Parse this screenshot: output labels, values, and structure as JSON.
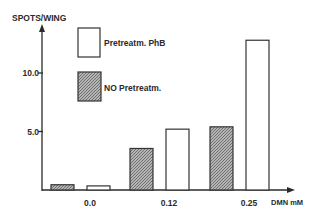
{
  "chart_data": {
    "type": "bar",
    "title": "",
    "xlabel": "DMN mM",
    "ylabel": "SPOTS/WING",
    "categories": [
      "0.0",
      "0.12",
      "0.25"
    ],
    "series": [
      {
        "name": "NO Pretreatm.",
        "pattern": "hatched",
        "values": [
          0.45,
          3.55,
          5.4
        ]
      },
      {
        "name": "Pretreatm. PhB",
        "pattern": "open",
        "values": [
          0.35,
          5.2,
          12.8
        ]
      }
    ],
    "yticks": [
      {
        "value": 5.0,
        "label": "5.0"
      },
      {
        "value": 10.0,
        "label": "10.0"
      }
    ],
    "ylim": [
      0,
      14
    ],
    "grid": false,
    "legend": {
      "placement": "top-left",
      "entries": [
        {
          "label": "Pretreatm. PhB",
          "pattern": "open"
        },
        {
          "label": "NO Pretreatm.",
          "pattern": "hatched"
        }
      ]
    },
    "colors": {
      "ink": "#2a2a2a",
      "hatch_fill": "#9a9a9a",
      "background": "#ffffff"
    }
  }
}
